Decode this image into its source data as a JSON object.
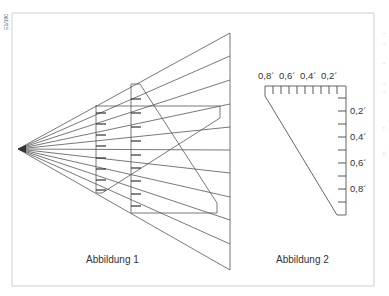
{
  "figure": {
    "side_label": "E1/190",
    "frame": {
      "x1": 12,
      "y1": 13,
      "x2": 374,
      "y2": 286,
      "color": "#cccccc"
    },
    "line_color": "#555555"
  },
  "abbildung1": {
    "caption": "Abbildung 1",
    "apex": [
      18,
      149
    ],
    "ray_end_x": 230,
    "ray_end_y": [
      33,
      56,
      80,
      104,
      127,
      150,
      173,
      197,
      220,
      244,
      270
    ],
    "near_plane_x": 96,
    "far_plane_x": 131
  },
  "abbildung2": {
    "caption": "Abbildung 2",
    "top_scale_labels": [
      "0,8´",
      "0,6´",
      "0,4´",
      "0,2´"
    ],
    "right_scale_labels": [
      "0,2´",
      "0,4´",
      "0,6´",
      "0,8´"
    ]
  },
  "right_edge_marks": [
    "·",
    "·",
    "·",
    "·",
    "·",
    ":",
    ":"
  ]
}
